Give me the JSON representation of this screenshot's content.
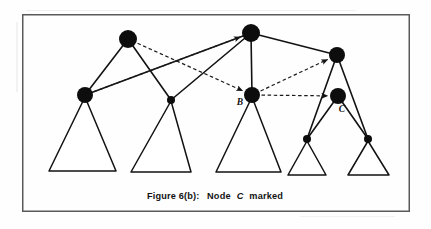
{
  "figure": {
    "caption_prefix": "Figure 6(b):",
    "caption_middle": "Node",
    "caption_italic": "C",
    "caption_suffix": "marked",
    "caption_full": "Figure 6(b):  Node C marked",
    "frame": {
      "x": 22,
      "y": 14,
      "width": 388,
      "height": 198
    },
    "colors": {
      "node_fill": "#0d0d0d",
      "edge_stroke": "#121212",
      "dashed_stroke": "#1a1a1a",
      "frame_stroke": "#5a5a5a",
      "background": "#ffffff",
      "caption_fill": "#141414"
    }
  },
  "graph": {
    "nodes": [
      {
        "id": "n1",
        "label": "",
        "x": 128,
        "y": 39,
        "r": 9,
        "marked": true
      },
      {
        "id": "n2",
        "label": "",
        "x": 85,
        "y": 95,
        "r": 8,
        "marked": true
      },
      {
        "id": "n3",
        "label": "",
        "x": 171,
        "y": 100,
        "r": 4,
        "marked": false
      },
      {
        "id": "n4",
        "label": "",
        "x": 251,
        "y": 33,
        "r": 9,
        "marked": true
      },
      {
        "id": "B",
        "label": "B",
        "x": 252,
        "y": 95,
        "r": 8,
        "marked": true,
        "label_x": 240,
        "label_y": 105
      },
      {
        "id": "n6",
        "label": "",
        "x": 337,
        "y": 55,
        "r": 8,
        "marked": true
      },
      {
        "id": "C",
        "label": "C",
        "x": 338,
        "y": 96,
        "r": 8,
        "marked": true,
        "label_x": 342,
        "label_y": 112
      },
      {
        "id": "n8",
        "label": "",
        "x": 307,
        "y": 139,
        "r": 4,
        "marked": false
      },
      {
        "id": "n9",
        "label": "",
        "x": 368,
        "y": 139,
        "r": 4,
        "marked": false
      }
    ],
    "solid_edges": [
      {
        "from": "n1",
        "to": "n2"
      },
      {
        "from": "n1",
        "to": "n3"
      },
      {
        "from": "n2",
        "to": "n4"
      },
      {
        "from": "n3",
        "to": "n4"
      },
      {
        "from": "n4",
        "to": "B"
      },
      {
        "from": "n4",
        "to": "n6"
      },
      {
        "from": "n6",
        "to": "n8"
      },
      {
        "from": "n6",
        "to": "n9"
      },
      {
        "from": "C",
        "to": "n8"
      },
      {
        "from": "C",
        "to": "n9"
      }
    ],
    "dashed_arrows": [
      {
        "from": "n2",
        "to": "n4",
        "label": "pointer-n2-to-top"
      },
      {
        "from": "n1",
        "to": "B",
        "label": "pointer-n1-to-B"
      },
      {
        "from": "B",
        "to": "n6",
        "label": "pointer-B-to-right-top"
      },
      {
        "from": "B",
        "to": "C",
        "label": "pointer-B-to-C"
      }
    ],
    "subtrees": [
      {
        "id": "t1",
        "apex_x": 85,
        "apex_y": 97,
        "left_x": 49,
        "right_x": 116,
        "base_y": 171
      },
      {
        "id": "t2",
        "apex_x": 171,
        "apex_y": 101,
        "left_x": 131,
        "right_x": 191,
        "base_y": 172
      },
      {
        "id": "t3",
        "apex_x": 252,
        "apex_y": 97,
        "left_x": 216,
        "right_x": 281,
        "base_y": 172
      },
      {
        "id": "t4",
        "apex_x": 307,
        "apex_y": 141,
        "left_x": 288,
        "right_x": 326,
        "base_y": 175
      },
      {
        "id": "t5",
        "apex_x": 368,
        "apex_y": 141,
        "left_x": 348,
        "right_x": 389,
        "base_y": 175
      }
    ]
  }
}
